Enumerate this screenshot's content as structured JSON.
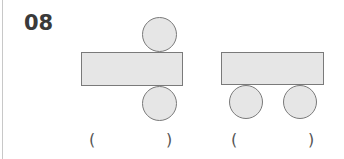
{
  "question": {
    "number": "08"
  },
  "figures": [
    {
      "label": "net-figure-1",
      "description": "rectangle with one circle above and one circle below",
      "answer_open": "(",
      "answer_close": ")"
    },
    {
      "label": "net-figure-2",
      "description": "rectangle with two circles below",
      "answer_open": "(",
      "answer_close": ")"
    }
  ],
  "colors": {
    "shape_fill": "#e6e6e6",
    "shape_stroke": "#7a7a7a",
    "text": "#3a3a3a"
  }
}
